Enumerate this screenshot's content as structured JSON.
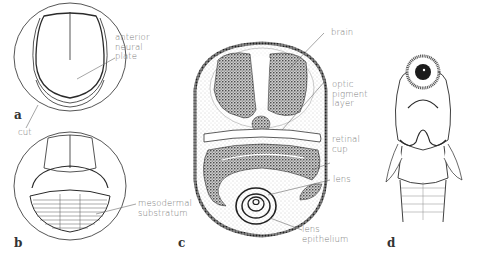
{
  "panels": {
    "a": {
      "letter": "a",
      "labels": {
        "anterior_neural_plate": "anterior\nneural\nplate",
        "cut": "cut"
      }
    },
    "b": {
      "letter": "b",
      "labels": {
        "mesodermal_substratum": "mesodermal\nsubstratum"
      }
    },
    "c": {
      "letter": "c",
      "labels": {
        "brain": "brain",
        "optic_pigment_layer": "optic\npigment\nlayer",
        "retinal_cup": "retinal\ncup",
        "lens": "lens",
        "lens_epithelium": "lens\nepithelium"
      }
    },
    "d": {
      "letter": "d"
    }
  },
  "colors": {
    "line": "#2a2a2a",
    "label": "#7a7a7a",
    "leader": "#6a6a6a",
    "stipple": "#9a9a9a",
    "tissue": "#3a3a3a"
  }
}
